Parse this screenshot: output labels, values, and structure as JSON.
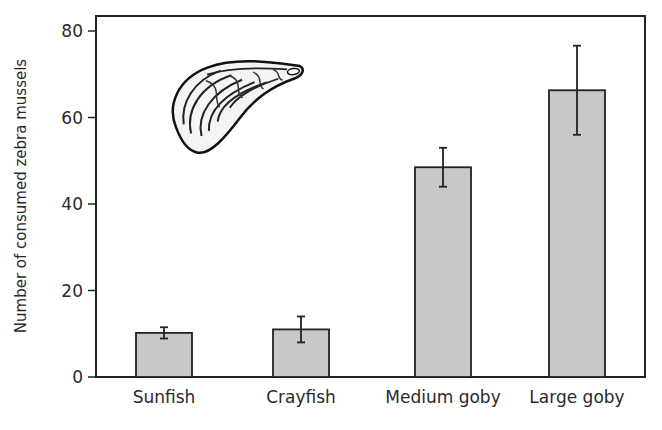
{
  "chart_data": {
    "type": "bar",
    "title": "",
    "xlabel": "",
    "ylabel": "Number of consumed zebra mussels",
    "ylim": [
      0,
      80
    ],
    "yticks": [
      0,
      20,
      40,
      60,
      80
    ],
    "categories": [
      "Sunfish",
      "Crayfish",
      "Medium goby",
      "Large goby"
    ],
    "values": [
      10.2,
      11,
      48.5,
      66.3
    ],
    "error": [
      1.3,
      3,
      4.5,
      10.3
    ],
    "grid": false,
    "legend": "none",
    "bar_color": "#c8c8c8",
    "annotation": "zebra-mussel-illustration"
  }
}
